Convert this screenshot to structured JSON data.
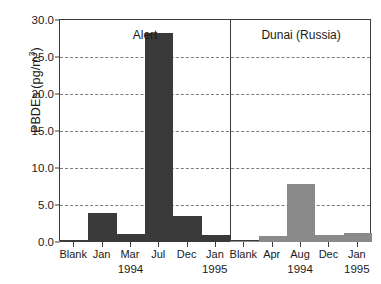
{
  "chart_data": {
    "type": "bar",
    "title": "",
    "xlabel": "",
    "ylabel": "PBDEs (pg/m",
    "ylabel_sup": "3",
    "ylabel_tail": ")",
    "ylim": [
      0,
      30
    ],
    "yticks": [
      "0.0",
      "5.0",
      "10.0",
      "15.0",
      "20.0",
      "25.0",
      "30.0"
    ],
    "ytick_values": [
      0,
      5,
      10,
      15,
      20,
      25,
      30
    ],
    "grid": "horizontal dashed at 5,10,15,20,25",
    "legend": "none",
    "panels": [
      {
        "name": "alert",
        "label": "Alert",
        "color": "#3a3a3a",
        "categories": [
          "Blank",
          "Jan",
          "Mar",
          "Jul",
          "Dec",
          "Jan"
        ],
        "values": [
          0.1,
          3.9,
          1.1,
          28.3,
          3.5,
          1.0
        ],
        "year_groups": [
          {
            "label": "1994",
            "center_fraction": 0.42
          },
          {
            "label": "1995",
            "center_fraction": 0.915
          }
        ]
      },
      {
        "name": "dunai",
        "label": "Dunai (Russia)",
        "color": "#8a8a8a",
        "categories": [
          "Blank",
          "Apr",
          "Aug",
          "Dec",
          "Jan"
        ],
        "values": [
          0.05,
          0.8,
          7.8,
          0.9,
          1.2
        ],
        "year_groups": [
          {
            "label": "1994",
            "center_fraction": 0.5
          },
          {
            "label": "1995",
            "center_fraction": 0.9
          }
        ]
      }
    ]
  }
}
